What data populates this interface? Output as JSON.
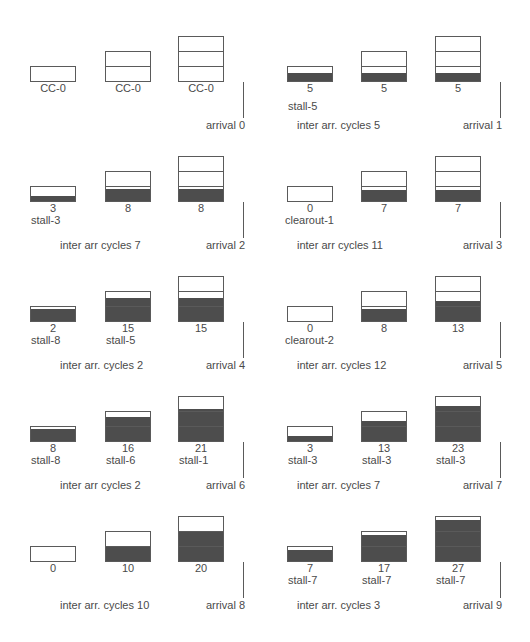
{
  "colors": {
    "fill": "#4d4d4d",
    "border": "#5a5a5a",
    "text": "#4a4a4a"
  },
  "panels": [
    {
      "arrival": "arrival 0",
      "inter": "",
      "boxes": [
        {
          "segments": 1,
          "fill": 0,
          "value": "CC-0",
          "sub": ""
        },
        {
          "segments": 2,
          "fill": 0,
          "value": "CC-0",
          "sub": ""
        },
        {
          "segments": 3,
          "fill": 0,
          "value": "CC-0",
          "sub": ""
        }
      ]
    },
    {
      "arrival": "arrival 1",
      "inter": "inter arr. cycles 5",
      "boxes": [
        {
          "segments": 1,
          "fill": 5,
          "value": "5",
          "sub": "stall-5"
        },
        {
          "segments": 2,
          "fill": 5,
          "value": "5",
          "sub": ""
        },
        {
          "segments": 3,
          "fill": 5,
          "value": "5",
          "sub": ""
        }
      ]
    },
    {
      "arrival": "arrival 2",
      "inter": "inter arr cycles 7",
      "boxes": [
        {
          "segments": 1,
          "fill": 3,
          "value": "3",
          "sub": "stall-3"
        },
        {
          "segments": 2,
          "fill": 8,
          "value": "8",
          "sub": ""
        },
        {
          "segments": 3,
          "fill": 8,
          "value": "8",
          "sub": ""
        }
      ]
    },
    {
      "arrival": "arrival 3",
      "inter": "inter arr cycles 11",
      "boxes": [
        {
          "segments": 1,
          "fill": 0,
          "value": "0",
          "sub": "clearout-1"
        },
        {
          "segments": 2,
          "fill": 7,
          "value": "7",
          "sub": ""
        },
        {
          "segments": 3,
          "fill": 7,
          "value": "7",
          "sub": ""
        }
      ]
    },
    {
      "arrival": "arrival 4",
      "inter": "inter arr. cycles 2",
      "boxes": [
        {
          "segments": 1,
          "fill": 8,
          "value": "2",
          "sub": "stall-8"
        },
        {
          "segments": 2,
          "fill": 15,
          "value": "15",
          "sub": "stall-5"
        },
        {
          "segments": 3,
          "fill": 15,
          "value": "15",
          "sub": ""
        }
      ]
    },
    {
      "arrival": "arrival 5",
      "inter": "inter arr. cycles 12",
      "boxes": [
        {
          "segments": 1,
          "fill": 0,
          "value": "0",
          "sub": "clearout-2"
        },
        {
          "segments": 2,
          "fill": 8,
          "value": "8",
          "sub": ""
        },
        {
          "segments": 3,
          "fill": 13,
          "value": "13",
          "sub": ""
        }
      ]
    },
    {
      "arrival": "arrival 6",
      "inter": "inter arr cycles 2",
      "boxes": [
        {
          "segments": 1,
          "fill": 8,
          "value": "8",
          "sub": "stall-8"
        },
        {
          "segments": 2,
          "fill": 16,
          "value": "16",
          "sub": "stall-6"
        },
        {
          "segments": 3,
          "fill": 21,
          "value": "21",
          "sub": "stall-1"
        }
      ]
    },
    {
      "arrival": "arrival 7",
      "inter": "inter arr. cycles 7",
      "boxes": [
        {
          "segments": 1,
          "fill": 3,
          "value": "3",
          "sub": "stall-3"
        },
        {
          "segments": 2,
          "fill": 13,
          "value": "13",
          "sub": "stall-3"
        },
        {
          "segments": 3,
          "fill": 23,
          "value": "23",
          "sub": "stall-3"
        }
      ]
    },
    {
      "arrival": "arrival 8",
      "inter": "inter arr. cycles 10",
      "boxes": [
        {
          "segments": 1,
          "fill": 0,
          "value": "0",
          "sub": ""
        },
        {
          "segments": 2,
          "fill": 10,
          "value": "10",
          "sub": ""
        },
        {
          "segments": 3,
          "fill": 20,
          "value": "20",
          "sub": ""
        }
      ]
    },
    {
      "arrival": "arrival 9",
      "inter": "inter arr. cycles 3",
      "boxes": [
        {
          "segments": 1,
          "fill": 7,
          "value": "7",
          "sub": "stall-7"
        },
        {
          "segments": 2,
          "fill": 17,
          "value": "17",
          "sub": "stall-7"
        },
        {
          "segments": 3,
          "fill": 27,
          "value": "27",
          "sub": "stall-7"
        }
      ]
    }
  ]
}
